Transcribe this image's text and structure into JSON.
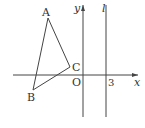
{
  "diagram": {
    "type": "coordinate-geometry",
    "axes": {
      "x_label": "x",
      "y_label": "y",
      "origin_label": "O"
    },
    "line_l": {
      "label": "l",
      "x_value_label": "3"
    },
    "triangle": {
      "vertices": [
        {
          "name": "A",
          "x": 48,
          "y": 18
        },
        {
          "name": "B",
          "x": 33,
          "y": 90
        },
        {
          "name": "C",
          "x": 70,
          "y": 67
        }
      ]
    },
    "colors": {
      "stroke": "#444444",
      "background": "#ffffff"
    }
  }
}
